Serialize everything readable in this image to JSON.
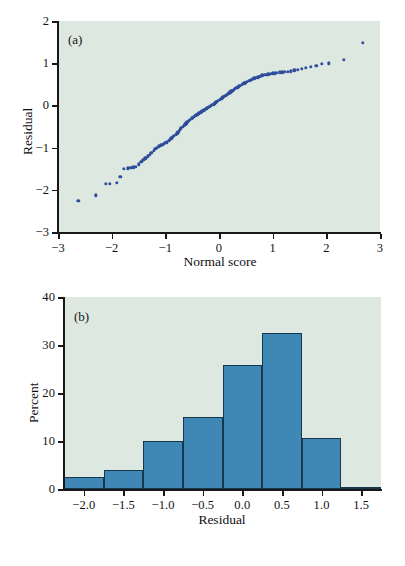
{
  "figure": {
    "background_color": "#ffffff",
    "panel_background_color": "#dde8e1",
    "scatter_color": "#2e4e9c",
    "bar_fill_color": "#3f87b5",
    "bar_edge_color": "#16384f",
    "axis_color": "#18181a"
  },
  "panel_a": {
    "tag": "(a)",
    "xlabel": "Normal score",
    "ylabel": "Residual",
    "xticks": [
      "−3",
      "−2",
      "−1",
      "0",
      "1",
      "2",
      "3"
    ],
    "yticks": [
      "2",
      "1",
      "0",
      "−1",
      "−2",
      "−3"
    ]
  },
  "panel_b": {
    "tag": "(b)",
    "xlabel": "Residual",
    "ylabel": "Percent",
    "xticks": [
      "−2.0",
      "−1.5",
      "−1.0",
      "−0.5",
      "0.0",
      "0.5",
      "1.0",
      "1.5"
    ],
    "yticks": [
      "40",
      "30",
      "20",
      "10",
      "0"
    ]
  },
  "chart_data": [
    {
      "type": "scatter",
      "title": "(a)",
      "xlabel": "Normal score",
      "ylabel": "Residual",
      "xlim": [
        -3,
        3
      ],
      "ylim": [
        -3,
        2
      ],
      "xticks": [
        -3,
        -2,
        -1,
        0,
        1,
        2,
        3
      ],
      "yticks": [
        -3,
        -2,
        -1,
        0,
        1,
        2
      ],
      "grid": false,
      "legend": "none",
      "marker_color": "#2e4e9c",
      "description": "Normal probability (Q-Q) plot of residuals versus normal score; points follow a slightly concave curve indicating mild left skew.",
      "points": [
        [
          -2.62,
          -2.26
        ],
        [
          -2.3,
          -2.13
        ],
        [
          -2.11,
          -1.86
        ],
        [
          -2.03,
          -1.86
        ],
        [
          -1.9,
          -1.84
        ],
        [
          -1.84,
          -1.69
        ],
        [
          -1.77,
          -1.5
        ],
        [
          -1.7,
          -1.49
        ],
        [
          -1.65,
          -1.48
        ],
        [
          -1.6,
          -1.47
        ],
        [
          -1.55,
          -1.45
        ],
        [
          -1.5,
          -1.4
        ],
        [
          -1.45,
          -1.33
        ],
        [
          -1.41,
          -1.29
        ],
        [
          -1.37,
          -1.25
        ],
        [
          -1.33,
          -1.21
        ],
        [
          -1.29,
          -1.17
        ],
        [
          -1.26,
          -1.12
        ],
        [
          -1.22,
          -1.07
        ],
        [
          -1.19,
          -1.03
        ],
        [
          -1.16,
          -1.0
        ],
        [
          -1.12,
          -0.97
        ],
        [
          -1.09,
          -0.95
        ],
        [
          -1.06,
          -0.93
        ],
        [
          -1.03,
          -0.91
        ],
        [
          -1.0,
          -0.89
        ],
        [
          -0.97,
          -0.87
        ],
        [
          -0.94,
          -0.84
        ],
        [
          -0.92,
          -0.81
        ],
        [
          -0.89,
          -0.78
        ],
        [
          -0.86,
          -0.75
        ],
        [
          -0.84,
          -0.72
        ],
        [
          -0.81,
          -0.69
        ],
        [
          -0.78,
          -0.66
        ],
        [
          -0.76,
          -0.62
        ],
        [
          -0.73,
          -0.58
        ],
        [
          -0.71,
          -0.54
        ],
        [
          -0.68,
          -0.51
        ],
        [
          -0.66,
          -0.48
        ],
        [
          -0.63,
          -0.45
        ],
        [
          -0.61,
          -0.42
        ],
        [
          -0.59,
          -0.39
        ],
        [
          -0.56,
          -0.36
        ],
        [
          -0.54,
          -0.34
        ],
        [
          -0.51,
          -0.31
        ],
        [
          -0.49,
          -0.29
        ],
        [
          -0.47,
          -0.27
        ],
        [
          -0.44,
          -0.25
        ],
        [
          -0.42,
          -0.23
        ],
        [
          -0.4,
          -0.21
        ],
        [
          -0.38,
          -0.19
        ],
        [
          -0.35,
          -0.17
        ],
        [
          -0.33,
          -0.15
        ],
        [
          -0.31,
          -0.13
        ],
        [
          -0.28,
          -0.12
        ],
        [
          -0.26,
          -0.1
        ],
        [
          -0.24,
          -0.08
        ],
        [
          -0.22,
          -0.06
        ],
        [
          -0.19,
          -0.04
        ],
        [
          -0.17,
          -0.03
        ],
        [
          -0.15,
          -0.01
        ],
        [
          -0.13,
          0.01
        ],
        [
          -0.1,
          0.03
        ],
        [
          -0.08,
          0.05
        ],
        [
          -0.06,
          0.07
        ],
        [
          -0.04,
          0.09
        ],
        [
          -0.02,
          0.11
        ],
        [
          0.01,
          0.13
        ],
        [
          0.03,
          0.15
        ],
        [
          0.05,
          0.17
        ],
        [
          0.07,
          0.19
        ],
        [
          0.09,
          0.21
        ],
        [
          0.12,
          0.23
        ],
        [
          0.14,
          0.25
        ],
        [
          0.16,
          0.27
        ],
        [
          0.18,
          0.29
        ],
        [
          0.21,
          0.31
        ],
        [
          0.23,
          0.33
        ],
        [
          0.25,
          0.35
        ],
        [
          0.28,
          0.37
        ],
        [
          0.3,
          0.39
        ],
        [
          0.32,
          0.41
        ],
        [
          0.35,
          0.43
        ],
        [
          0.37,
          0.45
        ],
        [
          0.39,
          0.47
        ],
        [
          0.42,
          0.49
        ],
        [
          0.44,
          0.51
        ],
        [
          0.47,
          0.52
        ],
        [
          0.49,
          0.54
        ],
        [
          0.52,
          0.56
        ],
        [
          0.55,
          0.58
        ],
        [
          0.57,
          0.59
        ],
        [
          0.6,
          0.61
        ],
        [
          0.63,
          0.63
        ],
        [
          0.66,
          0.64
        ],
        [
          0.69,
          0.66
        ],
        [
          0.72,
          0.67
        ],
        [
          0.75,
          0.68
        ],
        [
          0.78,
          0.7
        ],
        [
          0.81,
          0.71
        ],
        [
          0.85,
          0.72
        ],
        [
          0.88,
          0.73
        ],
        [
          0.92,
          0.74
        ],
        [
          0.96,
          0.75
        ],
        [
          1.0,
          0.76
        ],
        [
          1.04,
          0.76
        ],
        [
          1.08,
          0.77
        ],
        [
          1.13,
          0.78
        ],
        [
          1.18,
          0.78
        ],
        [
          1.23,
          0.79
        ],
        [
          1.28,
          0.8
        ],
        [
          1.34,
          0.81
        ],
        [
          1.4,
          0.83
        ],
        [
          1.47,
          0.85
        ],
        [
          1.54,
          0.87
        ],
        [
          1.62,
          0.89
        ],
        [
          1.71,
          0.91
        ],
        [
          1.81,
          0.94
        ],
        [
          1.92,
          0.98
        ],
        [
          2.05,
          1.0
        ],
        [
          2.32,
          1.08
        ],
        [
          2.68,
          1.49
        ]
      ]
    },
    {
      "type": "bar",
      "title": "(b)",
      "xlabel": "Residual",
      "ylabel": "Percent",
      "xlim": [
        -2.25,
        1.75
      ],
      "ylim": [
        0,
        40
      ],
      "xticks": [
        -2.0,
        -1.5,
        -1.0,
        -0.5,
        0.0,
        0.5,
        1.0,
        1.5
      ],
      "yticks": [
        0,
        10,
        20,
        30,
        40
      ],
      "grid": false,
      "legend": "none",
      "histogram": true,
      "bin_edges": [
        -2.25,
        -1.75,
        -1.25,
        -0.75,
        -0.25,
        0.25,
        0.75,
        1.25,
        1.75
      ],
      "categories": [
        "-2.25 to -1.75",
        "-1.75 to -1.25",
        "-1.25 to -0.75",
        "-0.75 to -0.25",
        "-0.25 to 0.25",
        "0.25 to 0.75",
        "0.75 to 1.25",
        "1.25 to 1.75"
      ],
      "values": [
        2.6,
        4.0,
        10.1,
        14.9,
        25.8,
        32.6,
        10.7,
        0.5
      ],
      "description": "Histogram of residuals in percent; unimodal, slightly left-skewed, peaking in the 0.25 to 0.75 bin at about 32.6 percent."
    }
  ]
}
